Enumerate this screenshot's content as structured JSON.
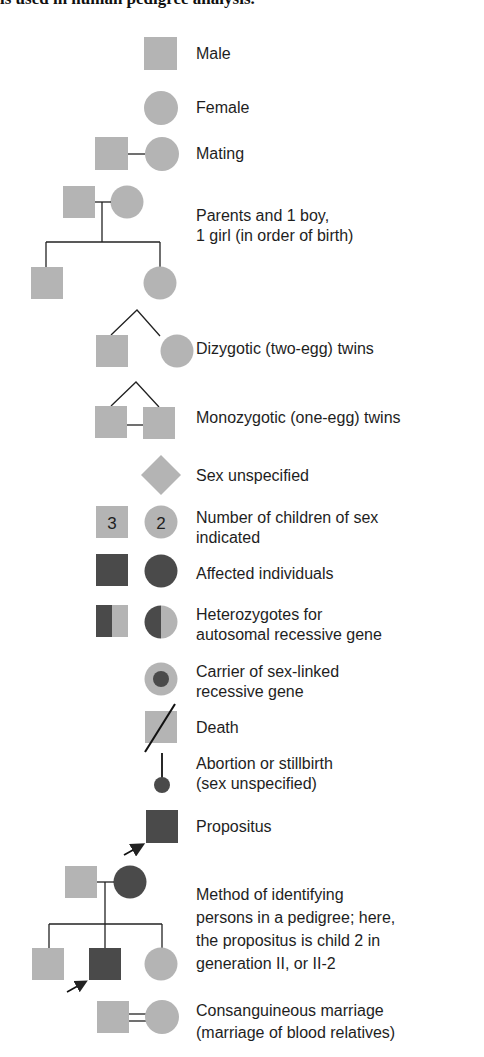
{
  "figure": {
    "heading_partial": "ls used in human pedigree analysis.",
    "colors": {
      "unaffected_fill": "#b4b4b4",
      "affected_fill": "#4a4a4a",
      "line": "#222222",
      "text": "#1e1e1e"
    }
  },
  "legend": [
    {
      "id": "male",
      "symbol": "square",
      "lines": [
        "Male"
      ]
    },
    {
      "id": "female",
      "symbol": "circle",
      "lines": [
        "Female"
      ]
    },
    {
      "id": "mating",
      "symbol": "square-line-circle",
      "lines": [
        "Mating"
      ]
    },
    {
      "id": "parents-children",
      "symbol": "family-tree",
      "lines": [
        "Parents and 1 boy,",
        "1 girl (in order of birth)"
      ]
    },
    {
      "id": "dizygotic-twins",
      "symbol": "twins-square-circle",
      "lines": [
        "Dizygotic (two-egg) twins"
      ]
    },
    {
      "id": "monozygotic-twins",
      "symbol": "twins-square-square-joined",
      "lines": [
        "Monozygotic (one-egg) twins"
      ]
    },
    {
      "id": "sex-unspecified",
      "symbol": "diamond",
      "lines": [
        "Sex unspecified"
      ]
    },
    {
      "id": "number-of-children",
      "symbol": "numbered-square-circle",
      "numbers": {
        "square": "3",
        "circle": "2"
      },
      "lines": [
        "Number of children of sex",
        "indicated"
      ]
    },
    {
      "id": "affected",
      "symbol": "filled-square-circle",
      "lines": [
        "Affected individuals"
      ]
    },
    {
      "id": "heterozygotes",
      "symbol": "half-filled-square-circle",
      "lines": [
        "Heterozygotes for",
        "autosomal recessive gene"
      ]
    },
    {
      "id": "carrier",
      "symbol": "dotted-circle",
      "lines": [
        "Carrier of sex-linked",
        "recessive gene"
      ]
    },
    {
      "id": "death",
      "symbol": "slashed-square",
      "lines": [
        "Death"
      ]
    },
    {
      "id": "abortion",
      "symbol": "stalk-dot",
      "lines": [
        "Abortion or stillbirth",
        "(sex unspecified)"
      ]
    },
    {
      "id": "propositus",
      "symbol": "arrow-filled-square",
      "lines": [
        "Propositus"
      ]
    },
    {
      "id": "identifying-method",
      "symbol": "pedigree-with-arrow",
      "lines": [
        "Method of identifying",
        "persons in a pedigree; here,",
        "the propositus is child 2 in",
        "generation II, or II-2"
      ]
    },
    {
      "id": "consanguineous",
      "symbol": "square-double-line-circle",
      "lines": [
        "Consanguineous marriage",
        "(marriage of blood relatives)"
      ]
    }
  ]
}
